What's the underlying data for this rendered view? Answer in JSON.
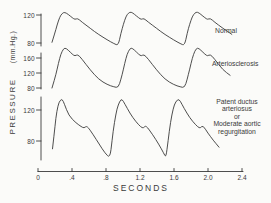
{
  "figure": {
    "colors": {
      "background": "#fbfbf9",
      "line": "#3a3a3a"
    },
    "y_axis": {
      "title": "PRESSURE",
      "units": "(mm.Hg.)"
    },
    "x_axis": {
      "label": "SECONDS",
      "ticks": [
        "0",
        ".4",
        ".8",
        "1.2",
        "1.6",
        "2.0",
        "2.4"
      ]
    },
    "panels": [
      {
        "label": "Normal",
        "y_ticks": [
          "120",
          "80"
        ]
      },
      {
        "label": "Arteriosclerosis",
        "y_ticks": [
          "160",
          "120",
          "80"
        ]
      },
      {
        "label_lines": [
          "Patent ductus",
          "arteriosus",
          "or",
          "Moderate aortic",
          "regurgitation"
        ],
        "y_ticks": [
          "120",
          "80"
        ]
      }
    ]
  },
  "chart_data": {
    "type": "line",
    "title": "",
    "xlabel": "SECONDS",
    "ylabel": "PRESSURE (mm.Hg.)",
    "x_range": [
      0,
      2.4
    ],
    "x_ticks": [
      0,
      0.4,
      0.8,
      1.2,
      1.6,
      2.0,
      2.4
    ],
    "grid": false,
    "legend_position": "right-of-each-trace",
    "panels": [
      {
        "name": "Normal",
        "y_ticks": [
          120,
          80
        ],
        "approx_systolic": 124,
        "approx_diastolic": 77,
        "beats": 3,
        "period_s": 0.78,
        "samples": [
          [
            0.165,
            81
          ],
          [
            0.195,
            93
          ],
          [
            0.225,
            106
          ],
          [
            0.255,
            117
          ],
          [
            0.285,
            122.5
          ],
          [
            0.315,
            124
          ],
          [
            0.355,
            121
          ],
          [
            0.405,
            116
          ],
          [
            0.435,
            113.5
          ],
          [
            0.465,
            115.5
          ],
          [
            0.515,
            110
          ],
          [
            0.615,
            101
          ],
          [
            0.715,
            92
          ],
          [
            0.815,
            84.5
          ],
          [
            0.895,
            79
          ],
          [
            0.945,
            76.5
          ],
          [
            0.975,
            94
          ],
          [
            1.005,
            107
          ],
          [
            1.035,
            118
          ],
          [
            1.065,
            123
          ],
          [
            1.095,
            124.5
          ],
          [
            1.135,
            121
          ],
          [
            1.185,
            116
          ],
          [
            1.215,
            113.5
          ],
          [
            1.245,
            115.5
          ],
          [
            1.295,
            110
          ],
          [
            1.395,
            101
          ],
          [
            1.495,
            92
          ],
          [
            1.595,
            84.5
          ],
          [
            1.675,
            79
          ],
          [
            1.725,
            76.5
          ],
          [
            1.755,
            94
          ],
          [
            1.785,
            107
          ],
          [
            1.815,
            118
          ],
          [
            1.845,
            123
          ],
          [
            1.875,
            124.5
          ],
          [
            1.915,
            121
          ],
          [
            1.965,
            116
          ],
          [
            1.995,
            113.5
          ],
          [
            2.025,
            115.5
          ],
          [
            2.075,
            110
          ],
          [
            2.175,
            101
          ],
          [
            2.28,
            92.5
          ]
        ]
      },
      {
        "name": "Arteriosclerosis",
        "y_ticks": [
          160,
          120,
          80
        ],
        "approx_systolic": 188,
        "approx_diastolic": 81,
        "beats": 3,
        "period_s": 0.78,
        "samples": [
          [
            0.165,
            80
          ],
          [
            0.195,
            103
          ],
          [
            0.225,
            130
          ],
          [
            0.255,
            160
          ],
          [
            0.285,
            179
          ],
          [
            0.315,
            188
          ],
          [
            0.355,
            181
          ],
          [
            0.405,
            170
          ],
          [
            0.435,
            165
          ],
          [
            0.465,
            170
          ],
          [
            0.515,
            158
          ],
          [
            0.615,
            128
          ],
          [
            0.715,
            103
          ],
          [
            0.815,
            89
          ],
          [
            0.895,
            83
          ],
          [
            0.945,
            81
          ],
          [
            0.975,
            103
          ],
          [
            1.005,
            130
          ],
          [
            1.035,
            160
          ],
          [
            1.065,
            179
          ],
          [
            1.095,
            188
          ],
          [
            1.135,
            181
          ],
          [
            1.185,
            170
          ],
          [
            1.215,
            165
          ],
          [
            1.245,
            170
          ],
          [
            1.295,
            158
          ],
          [
            1.395,
            128
          ],
          [
            1.495,
            103
          ],
          [
            1.595,
            89
          ],
          [
            1.675,
            83
          ],
          [
            1.725,
            81
          ],
          [
            1.755,
            103
          ],
          [
            1.785,
            130
          ],
          [
            1.815,
            160
          ],
          [
            1.845,
            179
          ],
          [
            1.875,
            188
          ],
          [
            1.915,
            181
          ],
          [
            1.965,
            170
          ],
          [
            1.995,
            165
          ],
          [
            2.025,
            170
          ],
          [
            2.075,
            158
          ],
          [
            2.175,
            128
          ],
          [
            2.26,
            114
          ]
        ]
      },
      {
        "name": "Patent ductus arteriosus or Moderate aortic regurgitation",
        "y_ticks": [
          120,
          80
        ],
        "approx_systolic": 134,
        "approx_diastolic": 58,
        "beats": 3,
        "period_s": 0.66,
        "samples": [
          [
            0.171,
            70
          ],
          [
            0.19,
            88
          ],
          [
            0.21,
            110
          ],
          [
            0.235,
            126
          ],
          [
            0.26,
            132.5
          ],
          [
            0.285,
            134
          ],
          [
            0.31,
            128
          ],
          [
            0.36,
            113
          ],
          [
            0.45,
            103
          ],
          [
            0.51,
            98.5
          ],
          [
            0.541,
            96.5
          ],
          [
            0.576,
            100
          ],
          [
            0.65,
            88
          ],
          [
            0.72,
            76
          ],
          [
            0.79,
            64
          ],
          [
            0.847,
            58
          ],
          [
            0.87,
            80
          ],
          [
            0.9,
            105
          ],
          [
            0.93,
            122
          ],
          [
            0.96,
            131
          ],
          [
            0.988,
            134.5
          ],
          [
            1.02,
            128
          ],
          [
            1.08,
            116
          ],
          [
            1.15,
            105
          ],
          [
            1.21,
            98
          ],
          [
            1.24,
            96.5
          ],
          [
            1.27,
            100.5
          ],
          [
            1.35,
            88
          ],
          [
            1.42,
            76
          ],
          [
            1.48,
            64
          ],
          [
            1.506,
            58.5
          ],
          [
            1.53,
            80
          ],
          [
            1.56,
            105
          ],
          [
            1.59,
            122
          ],
          [
            1.62,
            131
          ],
          [
            1.659,
            134.5
          ],
          [
            1.69,
            128
          ],
          [
            1.75,
            116
          ],
          [
            1.82,
            105
          ],
          [
            1.88,
            98
          ],
          [
            1.91,
            96.5
          ],
          [
            1.94,
            100.5
          ],
          [
            2.0,
            90
          ],
          [
            2.06,
            81
          ],
          [
            2.13,
            72
          ]
        ]
      }
    ]
  }
}
